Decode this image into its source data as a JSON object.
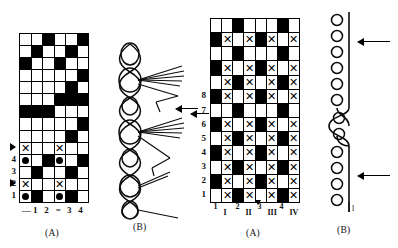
{
  "figure": {
    "panels": [
      {
        "id": "left-a",
        "caption": "(A)"
      },
      {
        "id": "left-b",
        "caption": "(B)"
      },
      {
        "id": "right-a",
        "caption": "(A)"
      },
      {
        "id": "right-b",
        "caption": "(B)"
      }
    ]
  },
  "left_chart": {
    "caption": "(A)",
    "columns": 6,
    "rows": 14,
    "row_labels": [
      "4",
      "3",
      "2",
      "1"
    ],
    "row_label_rows": [
      10,
      11,
      12,
      13
    ],
    "marker_rows": [
      9,
      12
    ],
    "marker_icon": "triangle-pointer",
    "column_labels": [
      "—",
      "1",
      "2",
      "=",
      "3",
      "4"
    ],
    "cells": [
      [
        0,
        0,
        1,
        0,
        0,
        1
      ],
      [
        0,
        1,
        0,
        0,
        1,
        0
      ],
      [
        1,
        0,
        0,
        1,
        0,
        0
      ],
      [
        0,
        0,
        0,
        0,
        0,
        1
      ],
      [
        0,
        0,
        0,
        0,
        1,
        0
      ],
      [
        0,
        0,
        0,
        1,
        1,
        1
      ],
      [
        1,
        1,
        1,
        0,
        0,
        0
      ],
      [
        0,
        0,
        0,
        0,
        0,
        1
      ],
      [
        0,
        0,
        0,
        0,
        1,
        0
      ],
      [
        0,
        0,
        0,
        0,
        0,
        0
      ],
      [
        0,
        0,
        1,
        0,
        0,
        1
      ],
      [
        0,
        1,
        0,
        0,
        1,
        0
      ],
      [
        0,
        0,
        0,
        0,
        0,
        0
      ],
      [
        0,
        1,
        0,
        0,
        1,
        0
      ]
    ],
    "symbols": [
      {
        "row": 9,
        "col": 0,
        "type": "x"
      },
      {
        "row": 9,
        "col": 3,
        "type": "x"
      },
      {
        "row": 10,
        "col": 0,
        "type": "dot"
      },
      {
        "row": 10,
        "col": 3,
        "type": "dot"
      },
      {
        "row": 12,
        "col": 0,
        "type": "x"
      },
      {
        "row": 12,
        "col": 3,
        "type": "x"
      },
      {
        "row": 13,
        "col": 0,
        "type": "dot"
      },
      {
        "row": 13,
        "col": 3,
        "type": "dot"
      }
    ]
  },
  "right_chart": {
    "caption": "(A)",
    "columns": 8,
    "rows": 13,
    "row_labels": [
      "8",
      "7",
      "6",
      "5",
      "4",
      "3",
      "2",
      "1"
    ],
    "column_labels_arabic": [
      "1",
      "2",
      "3",
      "4"
    ],
    "column_labels_roman": [
      "I",
      "II",
      "III",
      "IV"
    ],
    "marker_icon": "left-arrow",
    "cells": [
      [
        0,
        0,
        1,
        0,
        0,
        0,
        1,
        0
      ],
      [
        1,
        0,
        0,
        0,
        1,
        0,
        0,
        0
      ],
      [
        0,
        0,
        1,
        0,
        0,
        0,
        1,
        0
      ],
      [
        1,
        0,
        0,
        0,
        1,
        0,
        0,
        0
      ],
      [
        0,
        0,
        1,
        0,
        0,
        0,
        1,
        0
      ],
      [
        1,
        0,
        0,
        0,
        1,
        0,
        0,
        0
      ],
      [
        0,
        0,
        1,
        0,
        0,
        0,
        1,
        0
      ],
      [
        1,
        0,
        0,
        0,
        1,
        0,
        0,
        0
      ],
      [
        0,
        0,
        1,
        0,
        0,
        0,
        1,
        0
      ],
      [
        1,
        0,
        0,
        0,
        1,
        0,
        0,
        0
      ],
      [
        0,
        0,
        1,
        0,
        0,
        0,
        1,
        0
      ],
      [
        1,
        0,
        0,
        0,
        1,
        0,
        0,
        0
      ],
      [
        0,
        0,
        1,
        0,
        0,
        0,
        1,
        0
      ]
    ],
    "symbols": [
      {
        "row": 1,
        "col": 1,
        "type": "x"
      },
      {
        "row": 1,
        "col": 3,
        "type": "x"
      },
      {
        "row": 1,
        "col": 5,
        "type": "x"
      },
      {
        "row": 1,
        "col": 7,
        "type": "x"
      },
      {
        "row": 3,
        "col": 1,
        "type": "x"
      },
      {
        "row": 3,
        "col": 3,
        "type": "x"
      },
      {
        "row": 3,
        "col": 5,
        "type": "x"
      },
      {
        "row": 3,
        "col": 7,
        "type": "x"
      },
      {
        "row": 4,
        "col": 1,
        "type": "x"
      },
      {
        "row": 4,
        "col": 3,
        "type": "x"
      },
      {
        "row": 4,
        "col": 5,
        "type": "x"
      },
      {
        "row": 4,
        "col": 7,
        "type": "x"
      },
      {
        "row": 5,
        "col": 1,
        "type": "x"
      },
      {
        "row": 5,
        "col": 3,
        "type": "x"
      },
      {
        "row": 5,
        "col": 5,
        "type": "x"
      },
      {
        "row": 5,
        "col": 7,
        "type": "x"
      },
      {
        "row": 7,
        "col": 1,
        "type": "x"
      },
      {
        "row": 7,
        "col": 3,
        "type": "x"
      },
      {
        "row": 7,
        "col": 5,
        "type": "x"
      },
      {
        "row": 7,
        "col": 7,
        "type": "x"
      },
      {
        "row": 8,
        "col": 1,
        "type": "x"
      },
      {
        "row": 8,
        "col": 3,
        "type": "x"
      },
      {
        "row": 8,
        "col": 5,
        "type": "x"
      },
      {
        "row": 8,
        "col": 7,
        "type": "x"
      },
      {
        "row": 9,
        "col": 1,
        "type": "x"
      },
      {
        "row": 9,
        "col": 3,
        "type": "x"
      },
      {
        "row": 9,
        "col": 5,
        "type": "x"
      },
      {
        "row": 9,
        "col": 7,
        "type": "x"
      },
      {
        "row": 10,
        "col": 1,
        "type": "x"
      },
      {
        "row": 10,
        "col": 3,
        "type": "x"
      },
      {
        "row": 10,
        "col": 5,
        "type": "x"
      },
      {
        "row": 10,
        "col": 7,
        "type": "x"
      },
      {
        "row": 11,
        "col": 1,
        "type": "x"
      },
      {
        "row": 11,
        "col": 3,
        "type": "x"
      },
      {
        "row": 11,
        "col": 5,
        "type": "x"
      },
      {
        "row": 11,
        "col": 7,
        "type": "x"
      },
      {
        "row": 12,
        "col": 1,
        "type": "x"
      },
      {
        "row": 12,
        "col": 3,
        "type": "x"
      },
      {
        "row": 12,
        "col": 5,
        "type": "x"
      },
      {
        "row": 12,
        "col": 7,
        "type": "x"
      }
    ]
  },
  "left_diagram": {
    "caption": "(B)",
    "description": "yarn-loop-chain-with-float-bundles",
    "loop_count": 6,
    "colors": {
      "stroke": "#0d0d0d"
    }
  },
  "right_diagram": {
    "caption": "(B)",
    "description": "loop-chain-with-wavy-ground-line",
    "loop_count": 12,
    "end_label": "l",
    "colors": {
      "stroke": "#0d0d0d"
    }
  }
}
